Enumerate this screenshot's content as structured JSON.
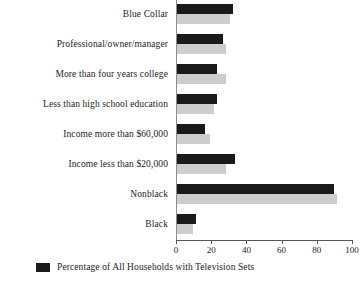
{
  "chart_data": {
    "type": "bar",
    "orientation": "horizontal",
    "title": "",
    "xlabel": "",
    "ylabel": "",
    "xlim": [
      0,
      100
    ],
    "xticks": [
      0,
      20,
      40,
      60,
      80,
      100
    ],
    "grid": false,
    "legend_position": "bottom-left",
    "categories": [
      "Blue Collar",
      "Professional/owner/manager",
      "More than four years college",
      "Less than high school education",
      "Income more than $60,000",
      "Income less than $20,000",
      "Nonblack",
      "Black"
    ],
    "series": [
      {
        "name": "Percentage of All Households with Television Sets",
        "color": "#1a1a1a",
        "values": [
          32,
          26,
          23,
          23,
          16,
          33,
          89,
          11
        ]
      },
      {
        "name": "",
        "color": "#cdcdcd",
        "values": [
          30,
          28,
          28,
          21,
          19,
          28,
          91,
          9
        ]
      }
    ]
  },
  "legend": {
    "items": [
      {
        "label": "Percentage of All Households with Television Sets",
        "color": "#1a1a1a"
      }
    ]
  },
  "colors": {
    "dark_bar": "#1a1a1a",
    "light_bar": "#cdcdcd",
    "axis": "#555555",
    "text": "#1c1c1c",
    "background": "#ffffff"
  }
}
